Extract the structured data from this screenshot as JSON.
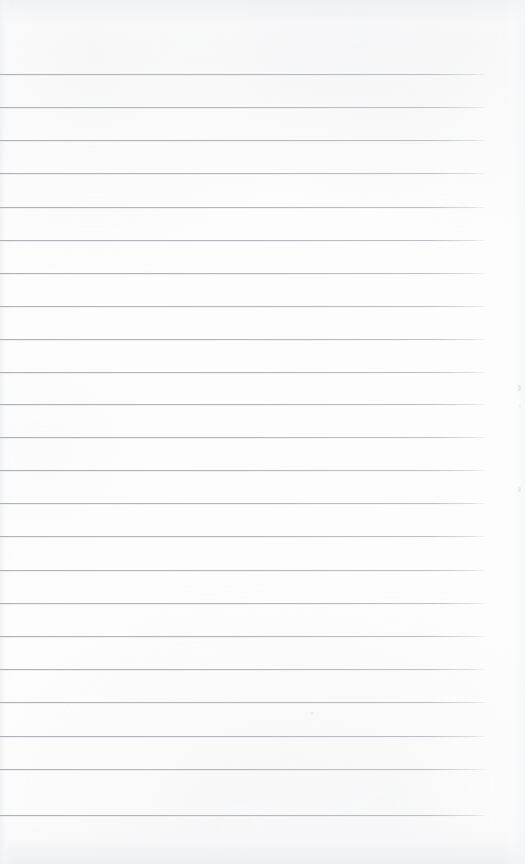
{
  "document": {
    "kind": "scanned-blank-ruled-page",
    "title": "Blank ruled notebook page",
    "width": 525,
    "height": 864,
    "paper_color": "#fdfdfd",
    "rule_color": "#b5b9bf",
    "shadow_tint_color": "#eeeff1",
    "text_content": "",
    "has_handwriting": false,
    "has_printed_text": false
  },
  "ruling": {
    "line_count": 23,
    "first_line_y": 74,
    "line_spacing": 33.2,
    "last_line_y": 815,
    "line_left_x": 0,
    "line_right_x": 488,
    "line_thickness": 1,
    "bleeds_off_left_edge": true,
    "right_margin_width": 37,
    "lines": [
      {
        "index": 1,
        "y": 74,
        "left": 0,
        "right": 488
      },
      {
        "index": 2,
        "y": 107,
        "left": 0,
        "right": 488
      },
      {
        "index": 3,
        "y": 140,
        "left": 0,
        "right": 488
      },
      {
        "index": 4,
        "y": 173,
        "left": 0,
        "right": 487
      },
      {
        "index": 5,
        "y": 207,
        "left": 0,
        "right": 488
      },
      {
        "index": 6,
        "y": 240,
        "left": 0,
        "right": 488
      },
      {
        "index": 7,
        "y": 273,
        "left": 0,
        "right": 487
      },
      {
        "index": 8,
        "y": 306,
        "left": 0,
        "right": 488
      },
      {
        "index": 9,
        "y": 339,
        "left": 0,
        "right": 488
      },
      {
        "index": 10,
        "y": 372,
        "left": 0,
        "right": 487
      },
      {
        "index": 11,
        "y": 404,
        "left": 0,
        "right": 488
      },
      {
        "index": 12,
        "y": 437,
        "left": 0,
        "right": 488
      },
      {
        "index": 13,
        "y": 470,
        "left": 0,
        "right": 487
      },
      {
        "index": 14,
        "y": 503,
        "left": 0,
        "right": 488
      },
      {
        "index": 15,
        "y": 536,
        "left": 0,
        "right": 488
      },
      {
        "index": 16,
        "y": 570,
        "left": 0,
        "right": 487
      },
      {
        "index": 17,
        "y": 603,
        "left": 0,
        "right": 488
      },
      {
        "index": 18,
        "y": 636,
        "left": 0,
        "right": 488
      },
      {
        "index": 19,
        "y": 669,
        "left": 0,
        "right": 487
      },
      {
        "index": 20,
        "y": 702,
        "left": 0,
        "right": 488
      },
      {
        "index": 21,
        "y": 736,
        "left": 0,
        "right": 488
      },
      {
        "index": 22,
        "y": 769,
        "left": 0,
        "right": 487
      },
      {
        "index": 23,
        "y": 815,
        "left": 0,
        "right": 488
      }
    ]
  },
  "scan_artifacts": {
    "specks": [
      {
        "x": 518,
        "y": 385,
        "w": 3,
        "h": 6,
        "opacity": 0.55
      },
      {
        "x": 518,
        "y": 487,
        "w": 3,
        "h": 5,
        "opacity": 0.45
      },
      {
        "x": 519,
        "y": 404,
        "w": 2,
        "h": 3,
        "opacity": 0.3
      },
      {
        "x": 310,
        "y": 712,
        "w": 4,
        "h": 3,
        "opacity": 0.3
      }
    ],
    "edge_shading": [
      "top",
      "bottom",
      "left",
      "right"
    ]
  }
}
